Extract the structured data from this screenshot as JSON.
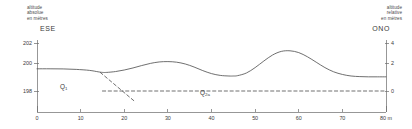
{
  "figure": {
    "width": 412,
    "height": 129,
    "background": "#ffffff",
    "line_color": "#555555",
    "axis_color": "#6b6b6b",
    "text_color": "#3a3a3a"
  },
  "left_axis": {
    "caption": "altitude\nabsolue\nen mètres",
    "direction_label": "ESE",
    "ticks": [
      {
        "value": 202,
        "label": "202",
        "y_px": 43
      },
      {
        "value": 200,
        "label": "200",
        "y_px": 63
      },
      {
        "value": 198,
        "label": "198",
        "y_px": 91
      }
    ],
    "range": [
      197,
      203
    ]
  },
  "right_axis": {
    "caption": "altitude\nrelative\nen mètres",
    "direction_label": "ONO",
    "ticks": [
      {
        "value": 4,
        "label": "4",
        "y_px": 43
      },
      {
        "value": 2,
        "label": "2",
        "y_px": 63
      },
      {
        "value": 0,
        "label": "0",
        "y_px": 91
      }
    ],
    "range": [
      -1,
      5
    ]
  },
  "x_axis": {
    "unit_label": "80 m",
    "ticks": [
      {
        "value": 0,
        "label": "0"
      },
      {
        "value": 10,
        "label": "10"
      },
      {
        "value": 20,
        "label": "20"
      },
      {
        "value": 30,
        "label": "30"
      },
      {
        "value": 40,
        "label": "40"
      },
      {
        "value": 50,
        "label": "50"
      },
      {
        "value": 60,
        "label": "60"
      },
      {
        "value": 70,
        "label": "70"
      },
      {
        "value": 80,
        "label": "80 m"
      }
    ],
    "range": [
      0,
      80
    ]
  },
  "units": [
    {
      "name": "unit-q1",
      "label": "Q",
      "subscript": "1"
    },
    {
      "name": "unit-q2a",
      "label": "Q",
      "subscript": "2a"
    }
  ],
  "chart_data": {
    "type": "line",
    "title": "",
    "xlabel": "80 m",
    "ylabel": "altitude absolue en mètres",
    "ylabel_secondary": "altitude relative en mètres",
    "xlim": [
      0,
      80
    ],
    "ylim": [
      197,
      203
    ],
    "ylim_secondary": [
      -1,
      5
    ],
    "grid": false,
    "legend": "none",
    "annotations": [
      {
        "text": "ESE",
        "position": "top-left",
        "meaning": "east-southeast direction"
      },
      {
        "text": "ONO",
        "position": "top-right",
        "meaning": "west-northwest direction"
      },
      {
        "text": "Q1",
        "x": 6,
        "y": 198.4,
        "meaning": "stratigraphic unit Q1"
      },
      {
        "text": "Q2a",
        "x": 42,
        "y": 197.9,
        "meaning": "stratigraphic unit Q2a"
      }
    ],
    "series": [
      {
        "name": "ground surface profile",
        "style": "solid",
        "color": "#555555",
        "x": [
          0,
          3,
          6,
          9,
          12,
          14,
          15,
          16,
          18,
          20,
          22,
          24,
          26,
          28,
          30,
          32,
          34,
          36,
          38,
          40,
          42,
          44,
          45,
          46,
          48,
          50,
          52,
          54,
          56,
          58,
          60,
          62,
          64,
          66,
          68,
          70,
          72,
          74,
          76,
          78,
          80
        ],
        "y": [
          199.85,
          199.85,
          199.84,
          199.8,
          199.72,
          199.6,
          199.55,
          199.55,
          199.62,
          199.75,
          199.92,
          200.12,
          200.3,
          200.42,
          200.45,
          200.4,
          200.25,
          200.0,
          199.7,
          199.45,
          199.3,
          199.25,
          199.25,
          199.28,
          199.5,
          199.95,
          200.5,
          201.0,
          201.3,
          201.35,
          201.2,
          200.85,
          200.4,
          199.95,
          199.6,
          199.38,
          199.25,
          199.2,
          199.18,
          199.18,
          199.18
        ]
      },
      {
        "name": "horizontal reference datum",
        "style": "dashed",
        "color": "#555555",
        "x": [
          15,
          80
        ],
        "y": [
          198.0,
          198.0
        ]
      },
      {
        "name": "unit boundary inferred",
        "style": "dashed",
        "color": "#555555",
        "x": [
          14.5,
          22.5
        ],
        "y": [
          199.55,
          197.1
        ]
      }
    ]
  }
}
